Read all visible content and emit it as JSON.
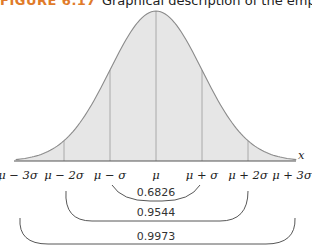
{
  "title": {
    "figure_label": "FIGURE 6.17",
    "caption": "Graphical description of the empirical rule"
  },
  "chart_data": {
    "type": "area",
    "title": "Graphical description of the empirical rule",
    "xlabel": "x",
    "ylabel": "",
    "x_tick_labels": [
      "μ − 3σ",
      "μ − 2σ",
      "μ − σ",
      "μ",
      "μ + σ",
      "μ + 2σ",
      "μ + 3σ"
    ],
    "x_in_sigma": [
      -3,
      -2,
      -1,
      0,
      1,
      2,
      3
    ],
    "curve": "normal density",
    "vertical_lines_at_sigma": [
      -2,
      -1,
      0,
      1,
      2
    ],
    "intervals": [
      {
        "range": [
          "μ − σ",
          "μ + σ"
        ],
        "probability": "0.6826"
      },
      {
        "range": [
          "μ − 2σ",
          "μ + 2σ"
        ],
        "probability": "0.9544"
      },
      {
        "range": [
          "μ − 3σ",
          "μ + 3σ"
        ],
        "probability": "0.9973"
      }
    ],
    "grid": false,
    "colors": {
      "fill": "#e6e6e6",
      "curve": "#8a8a8a",
      "axis": "#555555",
      "figure_label": "#e07b2a"
    }
  }
}
